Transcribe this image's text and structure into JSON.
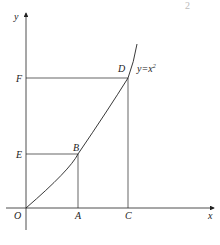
{
  "figure": {
    "corner_mark": "2",
    "caption": "",
    "curve_label": "y=x",
    "curve_exponent": "2",
    "axes": {
      "x_label": "x",
      "y_label": "y",
      "origin_label": "O"
    },
    "points": {
      "A": "A",
      "B": "B",
      "C": "C",
      "D": "D",
      "E": "E",
      "F": "F"
    },
    "colors": {
      "stroke": "#222222",
      "background": "#ffffff"
    }
  }
}
